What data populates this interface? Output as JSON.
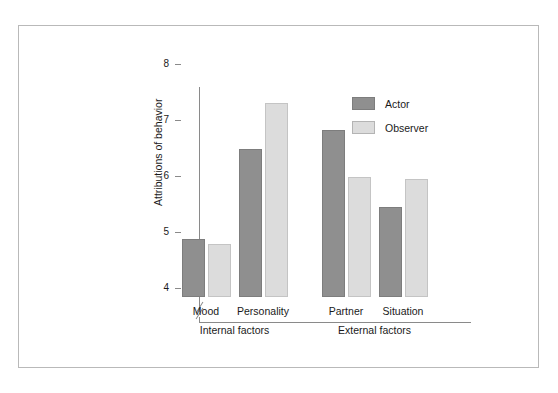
{
  "chart_data": {
    "type": "bar",
    "title": "",
    "xlabel": "",
    "ylabel": "Attributions of behavior",
    "ylim": [
      4,
      8
    ],
    "y_axis_break": true,
    "grid": false,
    "legend_position": "top-right",
    "categories": [
      "Mood",
      "Personality",
      "Partner",
      "Situation"
    ],
    "group_labels": [
      "Internal factors",
      "External factors"
    ],
    "groups": [
      {
        "label": "Internal factors",
        "categories": [
          "Mood",
          "Personality"
        ]
      },
      {
        "label": "External factors",
        "categories": [
          "Partner",
          "Situation"
        ]
      }
    ],
    "ytick_labels": [
      "8",
      "7",
      "6",
      "5",
      "4"
    ],
    "yticks": [
      8,
      7,
      6,
      5,
      4
    ],
    "series": [
      {
        "name": "Actor",
        "color": "#8f8f8f",
        "values": [
          4.88,
          6.48,
          6.82,
          5.45
        ]
      },
      {
        "name": "Observer",
        "color": "#dcdcdc",
        "values": [
          4.79,
          7.3,
          5.99,
          5.95
        ]
      }
    ]
  },
  "legend": {
    "items": [
      {
        "label": "Actor",
        "swatch": "actor"
      },
      {
        "label": "Observer",
        "swatch": "observer"
      }
    ]
  },
  "axis": {
    "y_title": "Attributions of behavior"
  }
}
